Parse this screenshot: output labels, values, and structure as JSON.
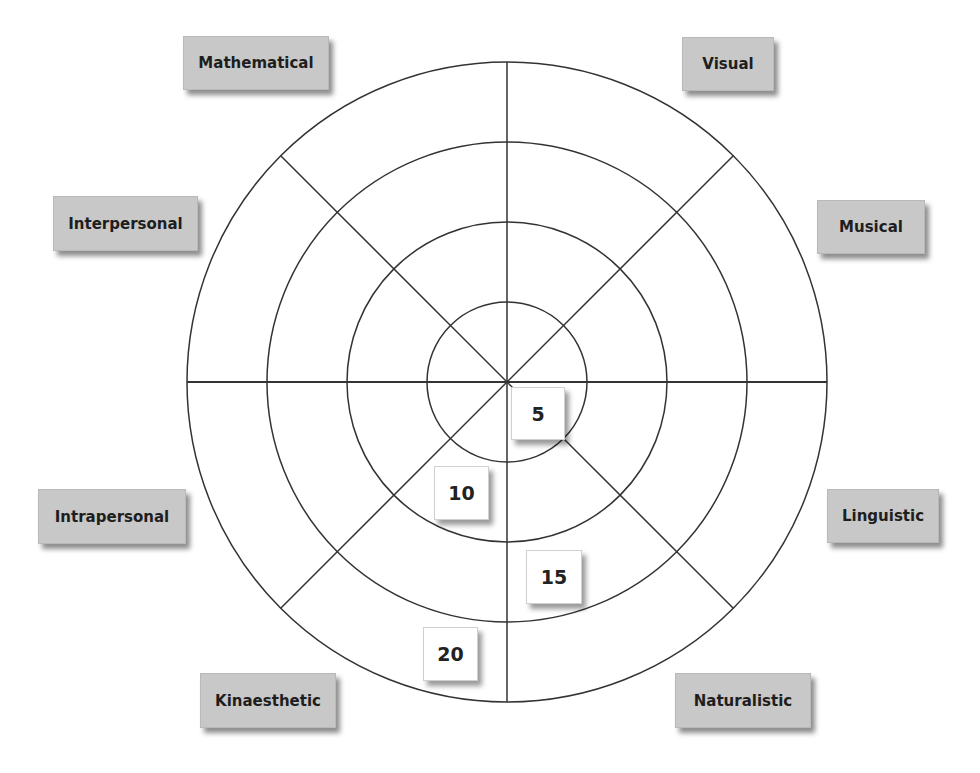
{
  "diagram": {
    "type": "multiple-intelligences-wheel",
    "segments": [
      {
        "id": "mathematical",
        "label": "Mathematical"
      },
      {
        "id": "visual",
        "label": "Visual"
      },
      {
        "id": "musical",
        "label": "Musical"
      },
      {
        "id": "linguistic",
        "label": "Linguistic"
      },
      {
        "id": "naturalistic",
        "label": "Naturalistic"
      },
      {
        "id": "kinaesthetic",
        "label": "Kinaesthetic"
      },
      {
        "id": "intrapersonal",
        "label": "Intrapersonal"
      },
      {
        "id": "interpersonal",
        "label": "Interpersonal"
      }
    ],
    "scale": [
      {
        "ring": 1,
        "value": "5"
      },
      {
        "ring": 2,
        "value": "10"
      },
      {
        "ring": 3,
        "value": "15"
      },
      {
        "ring": 4,
        "value": "20"
      }
    ],
    "colors": {
      "label_bg": "#c8c8c8",
      "line": "#333333",
      "value_bg": "#ffffff"
    }
  }
}
